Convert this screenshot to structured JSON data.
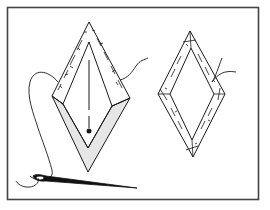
{
  "figure": {
    "colors": {
      "background": "#ffffff",
      "ink": "#1a1a1a",
      "frame": "#444444",
      "paper_template": "#e6e6e6"
    },
    "frame": {
      "x": 7,
      "y": 7,
      "width": 251,
      "height": 192
    },
    "left_diamond": {
      "label": "diamond-in-progress",
      "outer": {
        "top": [
          89,
          22
        ],
        "left": [
          52,
          96
        ],
        "right": [
          130,
          98
        ],
        "bottom": [
          88,
          172
        ]
      },
      "inner": {
        "top": [
          89,
          42
        ],
        "left": [
          63,
          96
        ],
        "right": [
          120,
          98
        ],
        "bottom": [
          88,
          148
        ]
      }
    },
    "right_diamond": {
      "label": "finished-basted-diamond",
      "outer": {
        "top": [
          190,
          31
        ],
        "left": [
          158,
          94
        ],
        "right": [
          225,
          94
        ],
        "bottom": [
          193,
          157
        ]
      },
      "inner": {
        "top": [
          191,
          48
        ],
        "left": [
          170,
          94
        ],
        "right": [
          214,
          94
        ],
        "bottom": [
          192,
          140
        ]
      }
    },
    "needle": {
      "eye": [
        35,
        178
      ],
      "tip": [
        137,
        188
      ]
    }
  }
}
